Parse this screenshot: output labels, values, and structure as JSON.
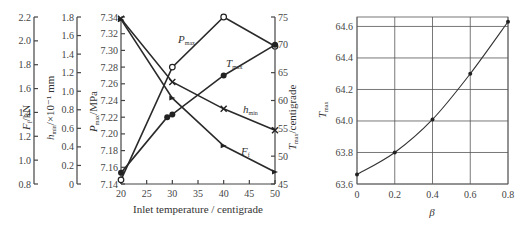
{
  "chart_data": [
    {
      "type": "line",
      "title": "",
      "xlabel": "Inlet temperature / centigrade",
      "x": [
        20,
        30,
        40,
        50
      ],
      "x_ticks": [
        "20",
        "25",
        "30",
        "35",
        "40",
        "45",
        "50"
      ],
      "xlim": [
        20,
        50
      ],
      "axes": [
        {
          "name": "F_f",
          "label": "F_f /kN",
          "ticks": [
            "0.8",
            "1.0",
            "1.2",
            "1.4",
            "1.6",
            "1.8",
            "2.0",
            "2.2"
          ],
          "range": [
            0.8,
            2.2
          ]
        },
        {
          "name": "h_min",
          "label": "h_min /×10⁻¹ mm",
          "ticks": [
            "0",
            "0.2",
            "0.4",
            "0.6",
            "0.8",
            "1.0",
            "1.2",
            "1.4",
            "1.6",
            "1.8"
          ],
          "range": [
            0,
            1.8
          ]
        },
        {
          "name": "P_max",
          "label": "P_max /MPa",
          "ticks": [
            "7.14",
            "7.16",
            "7.18",
            "7.20",
            "7.22",
            "7.24",
            "7.26",
            "7.28",
            "7.30",
            "7.32",
            "7.34"
          ],
          "range": [
            7.14,
            7.34
          ]
        },
        {
          "name": "T_max",
          "label": "T_max / centigrade",
          "ticks": [
            "45",
            "50",
            "55",
            "60",
            "65",
            "70",
            "75"
          ],
          "range": [
            45,
            75
          ]
        }
      ],
      "series": [
        {
          "name": "P_max",
          "label_main": "P",
          "label_sub": "max",
          "axis": "P_max",
          "x": [
            20,
            30,
            40,
            50
          ],
          "values": [
            7.145,
            7.28,
            7.34,
            7.305
          ],
          "marker": "open-circle"
        },
        {
          "name": "T_max",
          "label_main": "T",
          "label_sub": "max",
          "axis": "T_max",
          "x": [
            20,
            29,
            30,
            40,
            50
          ],
          "values": [
            47,
            57,
            57.5,
            64.5,
            70
          ],
          "marker": "filled-circle"
        },
        {
          "name": "h_min",
          "label_main": "h",
          "label_sub": "min",
          "axis": "h_min",
          "x": [
            20,
            30,
            40,
            50
          ],
          "values": [
            1.78,
            1.1,
            0.81,
            0.58
          ],
          "marker": "cross"
        },
        {
          "name": "F_f",
          "label_main": "F",
          "label_sub": "f",
          "axis": "F_f",
          "x": [
            20,
            30,
            40,
            50
          ],
          "values": [
            2.18,
            1.52,
            1.12,
            0.9
          ],
          "marker": "triangle"
        }
      ]
    },
    {
      "type": "line",
      "title": "",
      "xlabel": "β",
      "ylabel": "T_max",
      "x": [
        0,
        0.2,
        0.4,
        0.6,
        0.8
      ],
      "values": [
        63.66,
        63.8,
        64.01,
        64.3,
        64.63
      ],
      "x_ticks": [
        "0",
        "0.2",
        "0.4",
        "0.6",
        "0.8"
      ],
      "y_ticks": [
        "63.6",
        "63.8",
        "64.0",
        "64.2",
        "64.4",
        "64.6"
      ],
      "xlim": [
        0,
        0.8
      ],
      "ylim": [
        63.6,
        64.66
      ],
      "grid": true
    }
  ],
  "left": {
    "xlabel": "Inlet temperature / centigrade",
    "ff_label_main": "F",
    "ff_label_sub": "f",
    "ff_label_unit": "/kN",
    "h_label_main": "h",
    "h_label_sub": "min",
    "h_label_unit": "/×10⁻¹ mm",
    "p_label_main": "P",
    "p_label_sub": "max",
    "p_label_unit": "/MPa",
    "t_label_main": "T",
    "t_label_sub": "max",
    "t_label_unit": "/centigrade"
  },
  "right": {
    "xlabel": "β",
    "ylabel_main": "T",
    "ylabel_sub": "max"
  }
}
